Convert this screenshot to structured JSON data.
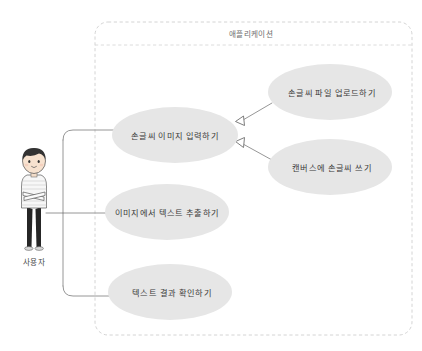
{
  "diagram": {
    "type": "uml-use-case-diagram",
    "background_color": "#ffffff"
  },
  "boundary": {
    "title": "애플리케이션",
    "stroke_color": "#cfcfcf",
    "style": "dashed-rounded-rectangle",
    "x": 95,
    "y": 22,
    "width": 317,
    "height": 313
  },
  "actor": {
    "label": "사용자",
    "hair_color": "#3b3b3b",
    "skin_color": "#f6e3d2",
    "shirt_color": "#f5f5f5",
    "trousers_color": "#262626",
    "x": 34,
    "y": 205
  },
  "use_cases": [
    {
      "id": "input-handwriting-image",
      "label": "손글씨 이미지 입력하기",
      "cx": 175,
      "cy": 135,
      "rx": 63,
      "ry": 28,
      "fill": "#e6e6e6"
    },
    {
      "id": "upload-handwriting-file",
      "label": "손글씨 파일 업로드하기",
      "cx": 330,
      "cy": 92,
      "rx": 62,
      "ry": 28,
      "fill": "#e6e6e6"
    },
    {
      "id": "write-handwriting-on-canvas",
      "label": "캔버스에 손글씨 쓰기",
      "cx": 330,
      "cy": 167,
      "rx": 62,
      "ry": 28,
      "fill": "#e6e6e6"
    },
    {
      "id": "extract-text-from-image",
      "label": "이미지에서 텍스트 추출하기",
      "cx": 167,
      "cy": 212,
      "rx": 62,
      "ry": 28,
      "fill": "#e6e6e6"
    },
    {
      "id": "check-text-result",
      "label": "텍스트 결과 확인하기",
      "cx": 170,
      "cy": 292,
      "rx": 62,
      "ry": 28,
      "fill": "#e6e6e6"
    }
  ],
  "associations": [
    {
      "id": "actor-to-input-handwriting-image",
      "from": "사용자",
      "to": "손글씨 이미지 입력하기"
    },
    {
      "id": "actor-to-extract-text-from-image",
      "from": "사용자",
      "to": "이미지에서 텍스트 추출하기"
    },
    {
      "id": "actor-to-check-text-result",
      "from": "사용자",
      "to": "텍스트 결과 확인하기"
    }
  ],
  "generalizations": [
    {
      "id": "upload-file-to-input-image",
      "from": "손글씨 파일 업로드하기",
      "to": "손글씨 이미지 입력하기",
      "arrow": "hollow-triangle"
    },
    {
      "id": "canvas-write-to-input-image",
      "from": "캔버스에 손글씨 쓰기",
      "to": "손글씨 이미지 입력하기",
      "arrow": "hollow-triangle"
    }
  ],
  "line_color": "#8a8a8a"
}
